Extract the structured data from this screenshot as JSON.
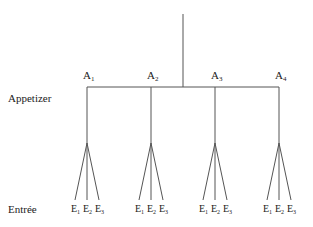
{
  "diagram": {
    "type": "tree",
    "line_color": "#555555",
    "levels": [
      {
        "label": "Appetizer"
      },
      {
        "label": "Entrée"
      }
    ],
    "root": {
      "x": 183,
      "y_top": 14,
      "y_bottom": 87
    },
    "appetizers": [
      {
        "base": "A",
        "sub": "1",
        "x": 87
      },
      {
        "base": "A",
        "sub": "2",
        "x": 151
      },
      {
        "base": "A",
        "sub": "3",
        "x": 215
      },
      {
        "base": "A",
        "sub": "4",
        "x": 279
      }
    ],
    "entrees": [
      {
        "base": "E",
        "sub": "1"
      },
      {
        "base": "E",
        "sub": "2"
      },
      {
        "base": "E",
        "sub": "3"
      }
    ]
  }
}
